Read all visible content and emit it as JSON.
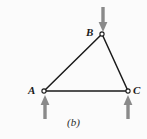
{
  "figure": {
    "caption": "(b)",
    "background_color": "#fbfbfb",
    "member_color": "#1a1a1a",
    "arrow_color": "#8a8a8a",
    "label_color": "#1a1a1a"
  },
  "nodes": [
    {
      "id": "A",
      "label": "A",
      "x": 44,
      "y": 91
    },
    {
      "id": "B",
      "label": "B",
      "x": 102,
      "y": 34
    },
    {
      "id": "C",
      "label": "C",
      "x": 128,
      "y": 91
    }
  ],
  "members": [
    {
      "from": "A",
      "to": "B"
    },
    {
      "from": "B",
      "to": "C"
    },
    {
      "from": "A",
      "to": "C"
    }
  ],
  "forces": [
    {
      "id": "load-at-B",
      "at_node": "B",
      "direction": "down",
      "x": 103,
      "tail_y": 7,
      "tip_y": 31
    },
    {
      "id": "reaction-at-A",
      "at_node": "A",
      "direction": "up",
      "x": 45,
      "tail_y": 119,
      "tip_y": 96
    },
    {
      "id": "reaction-at-C",
      "at_node": "C",
      "direction": "up",
      "x": 128,
      "tail_y": 119,
      "tip_y": 96
    }
  ]
}
